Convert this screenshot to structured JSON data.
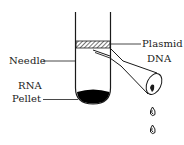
{
  "diagram": {
    "type": "labeled-illustration",
    "labels": {
      "plasmid_line1": "Plasmid",
      "plasmid_line2": "DNA",
      "needle": "Needle",
      "rna_line1": "RNA",
      "rna_line2": "Pellet"
    },
    "components": [
      "test-tube",
      "plasmid-dna-layer",
      "needle-syringe",
      "rna-pellet",
      "droplets"
    ],
    "colors": {
      "ink": "#1a1a1a",
      "background": "#ffffff",
      "pellet": "#000000"
    }
  }
}
